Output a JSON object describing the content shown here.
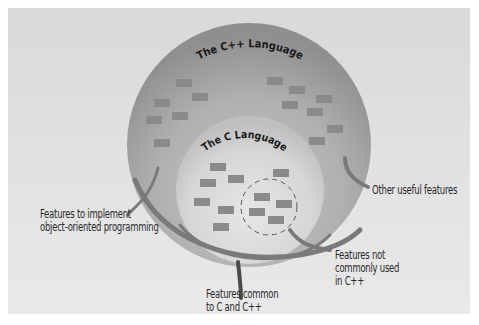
{
  "diagram": {
    "outer_circle": {
      "title": "The C++ Language",
      "fill_color": "#a9a9a9"
    },
    "inner_circle": {
      "title": "The C Language",
      "fill_color": "#d0d0d0"
    },
    "feature_block_color": "#8a8a8a",
    "callouts": [
      {
        "id": "oop",
        "text_lines": [
          "Features to implement",
          "object-oriented programming"
        ]
      },
      {
        "id": "other",
        "text_lines": [
          "Other useful features"
        ]
      },
      {
        "id": "not-common",
        "text_lines": [
          "Features not",
          "commonly used",
          "in C++"
        ]
      },
      {
        "id": "common",
        "text_lines": [
          "Features common",
          "to C and C++"
        ]
      }
    ]
  }
}
